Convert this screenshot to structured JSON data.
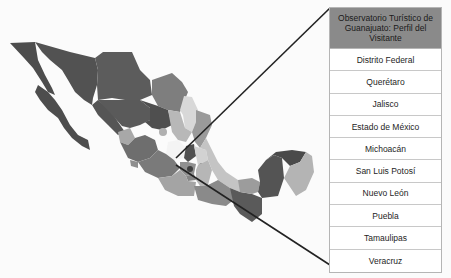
{
  "title": "Observatorio Turístico de Guanajuato: Perfil del Visitante",
  "states": [
    {
      "label": "Distrito Federal"
    },
    {
      "label": "Querétaro"
    },
    {
      "label": "Jalisco"
    },
    {
      "label": "Estado de México"
    },
    {
      "label": "Michoacán"
    },
    {
      "label": "San Luis Potosí"
    },
    {
      "label": "Nuevo León"
    },
    {
      "label": "Puebla"
    },
    {
      "label": "Tamaulipas"
    },
    {
      "label": "Veracruz"
    }
  ],
  "colors": {
    "header_bg": "#8a8a8a",
    "dark_state": "#4d4d4d",
    "mid_state": "#7a7a7a",
    "light_state": "#a8a8a8",
    "pale_state": "#d4d4d4",
    "callout_line": "#222222"
  }
}
